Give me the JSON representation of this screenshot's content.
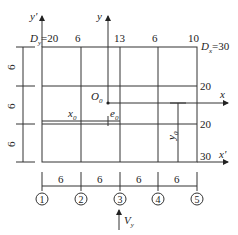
{
  "axes": {
    "y_prime": {
      "label": "y'"
    },
    "y": {
      "label": "y"
    },
    "x": {
      "label": "x"
    },
    "x_prime": {
      "label": "x'"
    }
  },
  "origin": {
    "label": "O",
    "sub": "0"
  },
  "stiffness_top": [
    "6",
    "13",
    "6",
    "10"
  ],
  "stiffness_right": [
    "20",
    "20",
    "30"
  ],
  "dy": {
    "main": "D",
    "sub": "y",
    "value": "=20"
  },
  "dx": {
    "main": "D",
    "sub": "x",
    "value": "=30"
  },
  "dims_left": [
    "6",
    "6",
    "6"
  ],
  "dims_bottom": [
    "6",
    "6",
    "6",
    "6"
  ],
  "axis_labels": [
    "1",
    "2",
    "3",
    "4",
    "5"
  ],
  "x0": {
    "main": "x",
    "sub": "0"
  },
  "e0": {
    "main": "e",
    "sub": "0"
  },
  "y0": {
    "main": "y",
    "sub": "0"
  },
  "force": {
    "main": "V",
    "sub": "y"
  }
}
